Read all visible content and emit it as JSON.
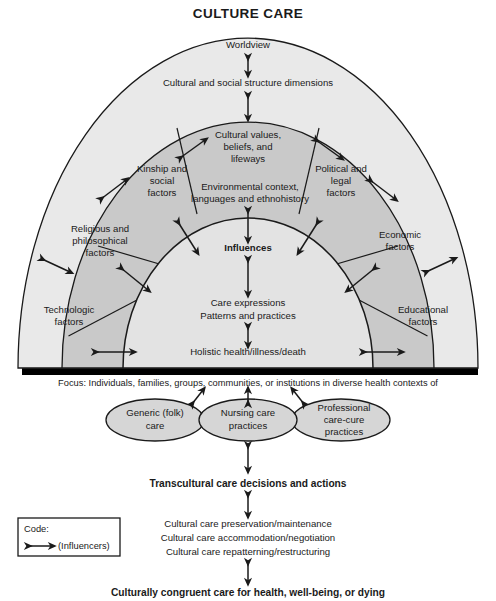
{
  "title": "CULTURE CARE",
  "dome": {
    "outer_band": {
      "labels": [
        {
          "text": "Worldview"
        },
        {
          "text": "Cultural and social structure dimensions"
        }
      ],
      "fill": "#e9e9e9"
    },
    "middle_band": {
      "fill": "#c9c9c9",
      "sectors": [
        {
          "name": "cultural-values",
          "lines": [
            "Cultural values,",
            "beliefs, and",
            "lifeways"
          ]
        },
        {
          "name": "kinship-social",
          "lines": [
            "Kinship and",
            "social",
            "factors"
          ]
        },
        {
          "name": "political-legal",
          "lines": [
            "Political and",
            "legal",
            "factors"
          ]
        },
        {
          "name": "religious-philosophical",
          "lines": [
            "Religious and",
            "philosophical",
            "factors"
          ]
        },
        {
          "name": "economic",
          "lines": [
            "Economic",
            "factors"
          ]
        },
        {
          "name": "technologic",
          "lines": [
            "Technologic",
            "factors"
          ]
        },
        {
          "name": "educational",
          "lines": [
            "Educational",
            "factors"
          ]
        },
        {
          "name": "environmental-context",
          "lines": [
            "Environmental context,",
            "languages and ethnohistory"
          ]
        }
      ]
    },
    "inner_core": {
      "fill": "#e3e3e3",
      "labels": [
        {
          "text": "Influences",
          "bold": true
        },
        {
          "text": "Care expressions"
        },
        {
          "text": "Patterns and practices"
        },
        {
          "text": "Holistic health/illness/death"
        }
      ]
    }
  },
  "focus_line": "Focus: Individuals, families, groups, communities, or institutions in diverse health contexts of",
  "practice_ellipses": [
    {
      "name": "generic-folk-care",
      "lines": [
        "Generic (folk)",
        "care"
      ],
      "fill": "#d6d6d6"
    },
    {
      "name": "nursing-care-practices",
      "lines": [
        "Nursing care",
        "practices"
      ],
      "fill": "#d6d6d6"
    },
    {
      "name": "professional-care-cure-practices",
      "lines": [
        "Professional",
        "care-cure",
        "practices"
      ],
      "fill": "#d6d6d6"
    }
  ],
  "decisions_heading": "Transcultural care decisions and actions",
  "care_actions": [
    "Cultural care preservation/maintenance",
    "Cultural care accommodation/negotiation",
    "Cultural care repatterning/restructuring"
  ],
  "outcome": "Culturally congruent care for health, well-being, or dying",
  "code_box": {
    "title": "Code:",
    "legend": "(Influencers)",
    "icon": "double-headed-arrow-icon"
  },
  "colors": {
    "stroke": "#1a1a1a",
    "base_bar": "#000000",
    "outer_band": "#e9e9e9",
    "middle_band": "#c9c9c9",
    "inner_core": "#e3e3e3",
    "ellipse": "#d6d6d6",
    "page_bg": "#ffffff"
  }
}
